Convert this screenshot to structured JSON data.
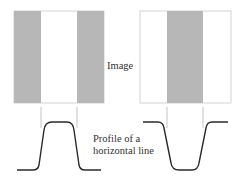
{
  "labels": {
    "image": "Image",
    "profile_line1": "Profile of a",
    "profile_line2": "horizontal line"
  },
  "colors": {
    "stripe": "#b7b7b7",
    "background": "#ffffff",
    "border": "#c8c8c8",
    "curve": "#2a2a2a",
    "guide": "#aaaaaa"
  },
  "panels": [
    {
      "name": "left",
      "pattern": "gray-white-gray",
      "profile": "bump-up"
    },
    {
      "name": "right",
      "pattern": "white-gray-white",
      "profile": "dip-down"
    }
  ]
}
